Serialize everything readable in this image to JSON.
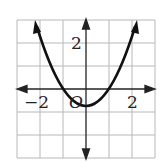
{
  "graph": {
    "function": "y = x^2 - 2",
    "x_range": [
      -3,
      3
    ],
    "y_range": [
      -3,
      3
    ],
    "grid_step": 1,
    "labels": {
      "x_neg": "−2",
      "x_pos": "2",
      "y_pos": "2",
      "origin": "O"
    },
    "colors": {
      "grid": "#b0b0b0",
      "axis": "#222222",
      "curve": "#111111"
    }
  }
}
